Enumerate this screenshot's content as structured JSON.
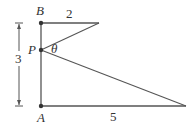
{
  "diagram": {
    "points": {
      "B": {
        "label": "B",
        "x": 41,
        "y": 23
      },
      "P": {
        "label": "P",
        "x": 41,
        "y": 50
      },
      "A": {
        "label": "A",
        "x": 41,
        "y": 106
      },
      "top_end": {
        "x": 99,
        "y": 23
      },
      "bottom_end": {
        "x": 186,
        "y": 106
      }
    },
    "labels": {
      "B": "B",
      "P": "P",
      "A": "A",
      "theta": "θ",
      "top_length": "2",
      "bottom_length": "5",
      "height": "3"
    },
    "colors": {
      "line": "#555555",
      "dot": "#333333",
      "text": "#333333"
    }
  }
}
